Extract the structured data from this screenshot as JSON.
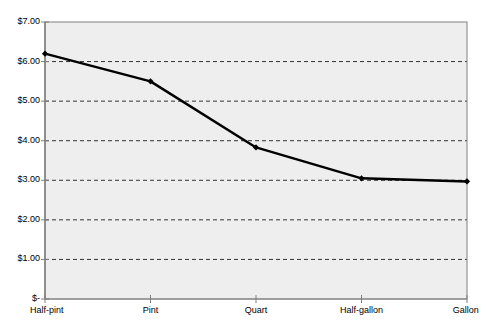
{
  "chart_data": {
    "type": "line",
    "title": "",
    "subtitle": "",
    "xlabel": "",
    "ylabel": "",
    "categories": [
      "Half-pint",
      "Pint",
      "Quart",
      "Half-gallon",
      "Gallon"
    ],
    "values": [
      6.2,
      5.5,
      3.83,
      3.05,
      2.97
    ],
    "series": [
      {
        "name": "Price",
        "values": [
          6.2,
          5.5,
          3.83,
          3.05,
          2.97
        ]
      }
    ],
    "ylim": [
      0,
      7
    ],
    "ytick_values": [
      7,
      6,
      5,
      4,
      3,
      2,
      1,
      0
    ],
    "ytick_labels": [
      "$7.00",
      "$6.00",
      "$5.00",
      "$4.00",
      "$3.00",
      "$2.00",
      "$1.00",
      "$-"
    ],
    "grid": "horizontal-dashed",
    "gridline_values": [
      6,
      5,
      4,
      3,
      2,
      1
    ],
    "legend": "none",
    "legend_position": "",
    "annotations": [],
    "marker": "diamond",
    "line_color": "#000000",
    "marker_color": "#000000",
    "plot_background_color": "#eeeeee",
    "figure_background_color": "#ffffff",
    "axis_color": "#808080",
    "gridline_color": "#333333"
  },
  "axes": {
    "y_axis_name": "price-axis",
    "x_axis_name": "container-size-axis"
  }
}
